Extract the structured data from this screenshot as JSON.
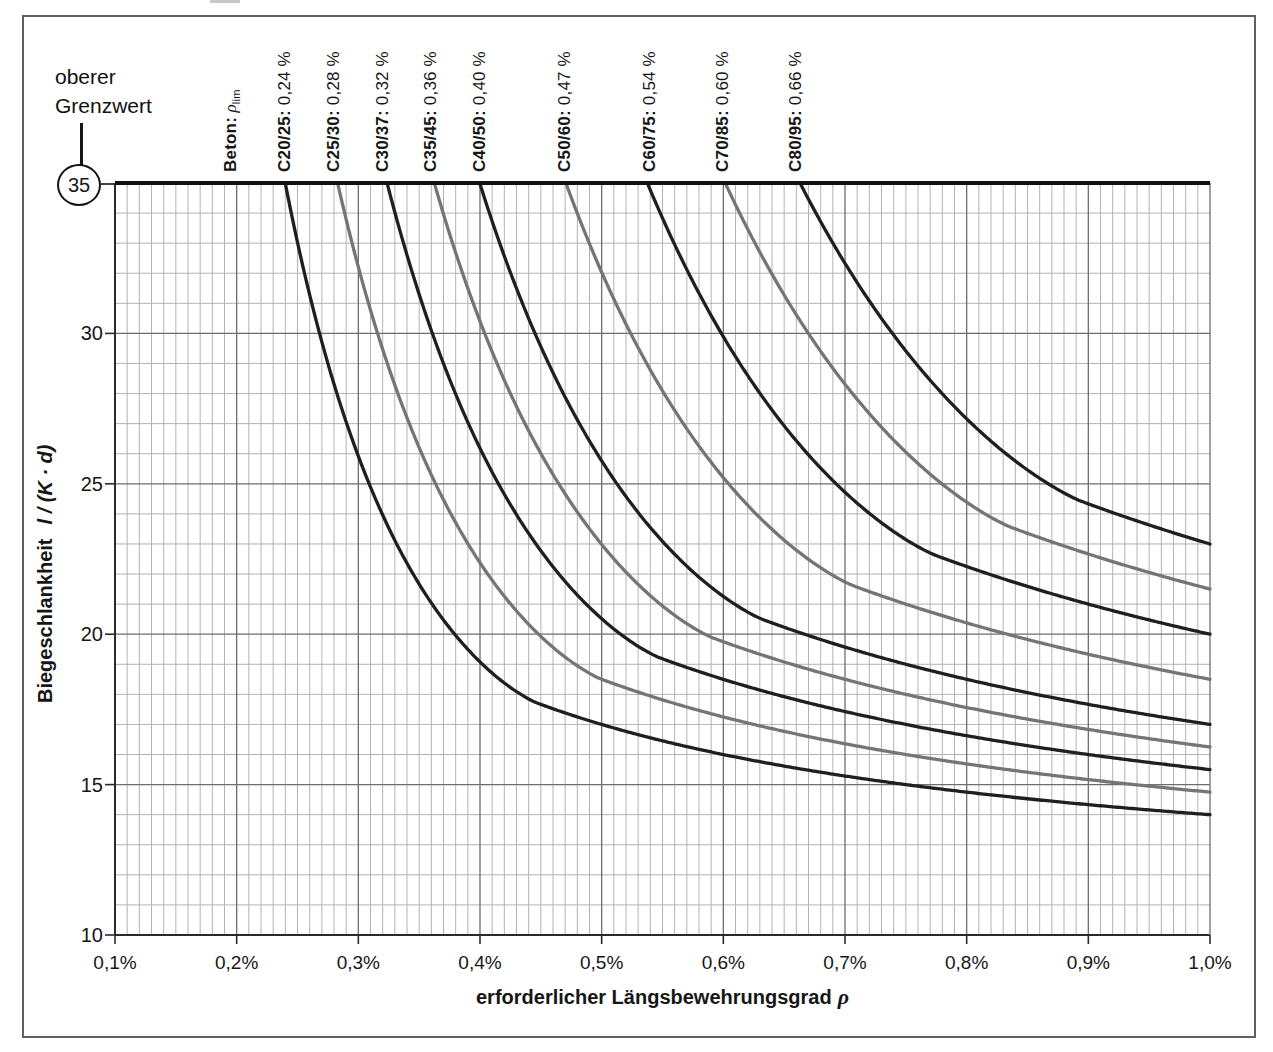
{
  "page": {
    "background": "#ffffff",
    "border_color": "#606060"
  },
  "annotation": {
    "line1": "oberer",
    "line2": "Grenzwert",
    "value": "35"
  },
  "chart_data": {
    "type": "line",
    "title": "",
    "xlabel": "erforderlicher Längsbewehrungsgrad ρ",
    "xlabel_name": "erforderlicher Längsbewehrungsgrad",
    "xlabel_symbol": "ρ",
    "ylabel": "Biegeschlankheit l / (K · d)",
    "ylabel_name": "Biegeschlankheit",
    "ylabel_math": "l / (K · d)",
    "xlim": [
      0.1,
      1.0
    ],
    "ylim": [
      10,
      35
    ],
    "x_unit": "%",
    "cap_value": 35,
    "upper_limit_note": "oberer Grenzwert = 35",
    "x_ticks": [
      {
        "value": 0.1,
        "label": "0,1%"
      },
      {
        "value": 0.2,
        "label": "0,2%"
      },
      {
        "value": 0.3,
        "label": "0,3%"
      },
      {
        "value": 0.4,
        "label": "0,4%"
      },
      {
        "value": 0.5,
        "label": "0,5%"
      },
      {
        "value": 0.6,
        "label": "0,6%"
      },
      {
        "value": 0.7,
        "label": "0,7%"
      },
      {
        "value": 0.8,
        "label": "0,8%"
      },
      {
        "value": 0.9,
        "label": "0,9%"
      },
      {
        "value": 1.0,
        "label": "1,0%"
      }
    ],
    "y_ticks": [
      {
        "value": 30,
        "label": "30"
      },
      {
        "value": 25,
        "label": "25"
      },
      {
        "value": 20,
        "label": "20"
      },
      {
        "value": 15,
        "label": "15"
      },
      {
        "value": 10,
        "label": "10"
      }
    ],
    "grid": {
      "x_minor_step": 0.01,
      "x_major_step": 0.1,
      "y_minor_step": 1,
      "y_major_step": 5,
      "minor_color": "#b3b3b3",
      "major_color": "#6e6e6e",
      "axis_color": "#2a2a2a",
      "cap_color": "#111111"
    },
    "column_header": {
      "bold": "Beton:",
      "symbol": " ρ",
      "subscript": "lim",
      "x_pct": 0.195
    },
    "formula": {
      "base": 11,
      "linear": 1.5,
      "nonlinear": 3.2,
      "power": 1.5
    },
    "series": [
      {
        "label": "C20/25",
        "bold_part": "C20/25:",
        "value_part": " 0,24 %",
        "rho_lim_pct": 0.24,
        "fck": 20,
        "rho0_pct": 0.4472,
        "color": "#1f1f1f",
        "key_points": [
          [
            0.24,
            35
          ],
          [
            0.7,
            15.3
          ],
          [
            1.0,
            14.0
          ]
        ]
      },
      {
        "label": "C25/30",
        "bold_part": "C25/30:",
        "value_part": " 0,28 %",
        "rho_lim_pct": 0.28,
        "fck": 25,
        "rho0_pct": 0.5,
        "color": "#757575",
        "key_points": [
          [
            0.28,
            35
          ],
          [
            0.7,
            16.4
          ],
          [
            1.0,
            14.75
          ]
        ]
      },
      {
        "label": "C30/37",
        "bold_part": "C30/37:",
        "value_part": " 0,32 %",
        "rho_lim_pct": 0.32,
        "fck": 30,
        "rho0_pct": 0.5477,
        "color": "#1f1f1f",
        "key_points": [
          [
            0.32,
            35
          ],
          [
            0.7,
            17.4
          ],
          [
            1.0,
            15.5
          ]
        ]
      },
      {
        "label": "C35/45",
        "bold_part": "C35/45:",
        "value_part": " 0,36 %",
        "rho_lim_pct": 0.36,
        "fck": 35,
        "rho0_pct": 0.5916,
        "color": "#757575",
        "key_points": [
          [
            0.36,
            35
          ],
          [
            0.7,
            18.5
          ],
          [
            1.0,
            16.25
          ]
        ]
      },
      {
        "label": "C40/50",
        "bold_part": "C40/50:",
        "value_part": " 0,40 %",
        "rho_lim_pct": 0.4,
        "fck": 40,
        "rho0_pct": 0.6325,
        "color": "#1f1f1f",
        "key_points": [
          [
            0.4,
            35
          ],
          [
            0.7,
            19.6
          ],
          [
            1.0,
            17.0
          ]
        ]
      },
      {
        "label": "C50/60",
        "bold_part": "C50/60:",
        "value_part": " 0,47 %",
        "rho_lim_pct": 0.47,
        "fck": 50,
        "rho0_pct": 0.7071,
        "color": "#757575",
        "key_points": [
          [
            0.47,
            35
          ],
          [
            0.7,
            21.7
          ],
          [
            1.0,
            18.5
          ]
        ]
      },
      {
        "label": "C60/75",
        "bold_part": "C60/75:",
        "value_part": " 0,54 %",
        "rho_lim_pct": 0.54,
        "fck": 60,
        "rho0_pct": 0.7746,
        "color": "#1f1f1f",
        "key_points": [
          [
            0.54,
            35
          ],
          [
            0.7,
            24.7
          ],
          [
            1.0,
            20.0
          ]
        ]
      },
      {
        "label": "C70/85",
        "bold_part": "C70/85:",
        "value_part": " 0,60 %",
        "rho_lim_pct": 0.6,
        "fck": 70,
        "rho0_pct": 0.8367,
        "color": "#757575",
        "key_points": [
          [
            0.6,
            35
          ],
          [
            0.7,
            28.3
          ],
          [
            1.0,
            21.5
          ]
        ]
      },
      {
        "label": "C80/95",
        "bold_part": "C80/95:",
        "value_part": " 0,66 %",
        "rho_lim_pct": 0.66,
        "fck": 80,
        "rho0_pct": 0.8944,
        "color": "#1f1f1f",
        "key_points": [
          [
            0.66,
            35
          ],
          [
            0.7,
            32.3
          ],
          [
            1.0,
            23.0
          ]
        ]
      }
    ]
  }
}
